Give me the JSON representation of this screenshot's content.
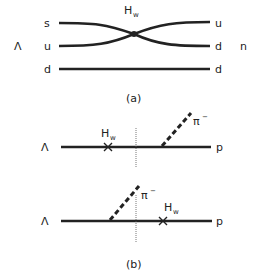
{
  "diagram_a": {
    "caption": "(a)",
    "vertex_label": "H",
    "vertex_sub": "w",
    "initial_particle": "Λ",
    "final_particle": "n",
    "left_quarks": [
      "s",
      "u",
      "d"
    ],
    "right_quarks": [
      "u",
      "d",
      "d"
    ]
  },
  "diagram_b": {
    "caption": "(b)",
    "top": {
      "initial": "Λ",
      "final": "p",
      "weak_label": "H",
      "weak_sub": "w",
      "pion_label": "π",
      "pion_sup": "−"
    },
    "bottom": {
      "initial": "Λ",
      "final": "p",
      "weak_label": "H",
      "weak_sub": "w",
      "pion_label": "π",
      "pion_sup": "−"
    }
  }
}
